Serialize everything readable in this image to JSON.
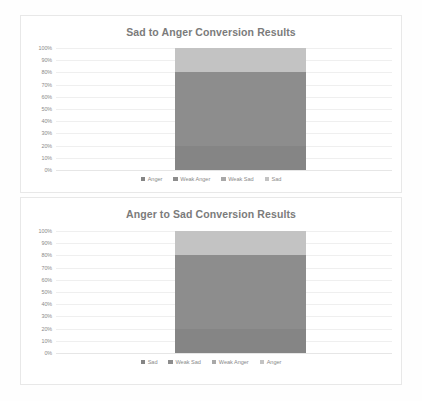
{
  "chart_data": [
    {
      "type": "bar",
      "title": "Sad to Anger Conversion Results",
      "xlabel": "",
      "ylabel": "",
      "ylim": [
        0,
        100
      ],
      "grid": true,
      "legend_position": "bottom",
      "stacked": true,
      "categories": [
        ""
      ],
      "ytick_labels": [
        "100%",
        "90%",
        "80%",
        "70%",
        "60%",
        "50%",
        "40%",
        "30%",
        "20%",
        "10%",
        "0%"
      ],
      "ytick_values": [
        100,
        90,
        80,
        70,
        60,
        50,
        40,
        30,
        20,
        10,
        0
      ],
      "series": [
        {
          "name": "Anger",
          "values": [
            20
          ],
          "color": "#858585"
        },
        {
          "name": "Weak Anger",
          "values": [
            60
          ],
          "color": "#8d8d8d"
        },
        {
          "name": "Weak Sad",
          "values": [
            0
          ],
          "color": "#a8a8a8"
        },
        {
          "name": "Sad",
          "values": [
            20
          ],
          "color": "#c3c3c3"
        }
      ]
    },
    {
      "type": "bar",
      "title": "Anger to Sad Conversion Results",
      "xlabel": "",
      "ylabel": "",
      "ylim": [
        0,
        100
      ],
      "grid": true,
      "legend_position": "bottom",
      "stacked": true,
      "categories": [
        ""
      ],
      "ytick_labels": [
        "100%",
        "90%",
        "80%",
        "70%",
        "60%",
        "50%",
        "40%",
        "30%",
        "20%",
        "10%",
        "0%"
      ],
      "ytick_values": [
        100,
        90,
        80,
        70,
        60,
        50,
        40,
        30,
        20,
        10,
        0
      ],
      "series": [
        {
          "name": "Sad",
          "values": [
            20
          ],
          "color": "#858585"
        },
        {
          "name": "Weak Sad",
          "values": [
            60
          ],
          "color": "#8d8d8d"
        },
        {
          "name": "Weak Anger",
          "values": [
            0
          ],
          "color": "#a8a8a8"
        },
        {
          "name": "Anger",
          "values": [
            20
          ],
          "color": "#c3c3c3"
        }
      ]
    }
  ]
}
